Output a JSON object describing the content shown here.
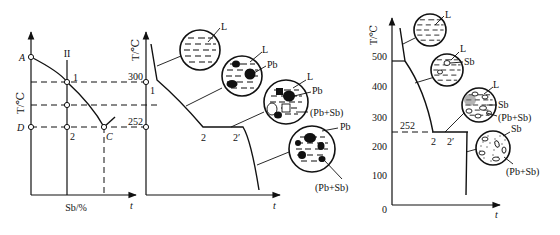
{
  "figure": {
    "panel_phase": {
      "y_axis_label": "T/℃",
      "x_axis_label": "Sb/%",
      "points": {
        "A": "A",
        "D": "D",
        "C": "C",
        "one": "1",
        "two": "2"
      },
      "alloy_line_label": "II"
    },
    "panel_cooling_pb": {
      "y_axis_label": "T/℃",
      "x_axis_label": "t",
      "temps": {
        "t300": "300",
        "t252": "252"
      },
      "points": {
        "one": "1",
        "two": "2",
        "two_prime": "2′"
      },
      "micro": [
        {
          "labels": [
            "L"
          ]
        },
        {
          "labels": [
            "L",
            "Pb"
          ]
        },
        {
          "labels": [
            "L",
            "Pb",
            "(Pb+Sb)"
          ]
        },
        {
          "labels": [
            "Pb",
            "(Pb+Sb)"
          ]
        }
      ]
    },
    "panel_cooling_sb": {
      "y_axis_label": "T/℃",
      "x_axis_label": "t",
      "ticks": [
        "500",
        "400",
        "300",
        "200",
        "100",
        "0"
      ],
      "eutectic_label": "252",
      "points": {
        "two": "2",
        "two_prime": "2′"
      },
      "micro": [
        {
          "labels": [
            "L"
          ]
        },
        {
          "labels": [
            "L",
            "Sb"
          ]
        },
        {
          "labels": [
            "L",
            "Sb",
            "(Pb+Sb)"
          ]
        },
        {
          "labels": [
            "Sb",
            "(Pb+Sb)"
          ]
        }
      ]
    },
    "left_x_axis_t": "t"
  }
}
